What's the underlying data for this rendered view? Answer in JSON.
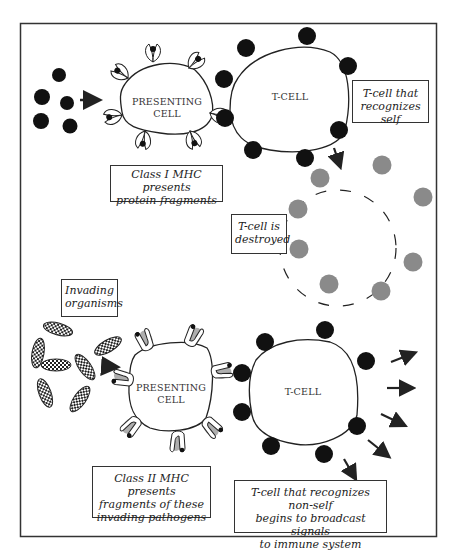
{
  "figure": {
    "colors": {
      "frame": "#333333",
      "receptor_dark": "#1a1a1a",
      "destroyed_receptor": "#8a8a8a",
      "mhc2_shade": "#9a9a9a"
    }
  },
  "top_panel": {
    "presenting_cell_label": [
      "PRESENTING",
      "CELL"
    ],
    "tcell_label": "T-CELL",
    "caption_mhc1": [
      "Class I MHC presents",
      "protein fragments"
    ],
    "caption_self": [
      "T-cell that",
      "recognizes self"
    ],
    "caption_destroyed": [
      "T-cell is",
      "destroyed"
    ]
  },
  "bottom_panel": {
    "caption_invaders": [
      "Invading",
      "organisms"
    ],
    "presenting_cell_label": [
      "PRESENTING",
      "CELL"
    ],
    "tcell_label": "T-CELL",
    "caption_mhc2": [
      "Class II MHC presents",
      "fragments of these",
      "invading pathogens"
    ],
    "caption_nonself": [
      "T-cell that recognizes non-self",
      "begins to broadcast signals",
      "to immune system"
    ]
  }
}
